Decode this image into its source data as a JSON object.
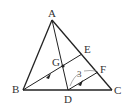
{
  "diagram": {
    "points": {
      "A": "A",
      "B": "B",
      "C": "C",
      "D": "D",
      "E": "E",
      "F": "F",
      "G": "G"
    },
    "segments": [
      {
        "from": "A",
        "to": "B"
      },
      {
        "from": "A",
        "to": "C"
      },
      {
        "from": "B",
        "to": "C"
      },
      {
        "from": "A",
        "to": "D"
      },
      {
        "from": "B",
        "to": "E"
      },
      {
        "from": "D",
        "to": "F"
      }
    ],
    "parallel_marks": [
      "BE",
      "DF"
    ],
    "measurement": {
      "segment": "DF",
      "label": "3"
    },
    "colors": {
      "line": "#222222",
      "text": "#333333",
      "mark": "#555555"
    }
  }
}
